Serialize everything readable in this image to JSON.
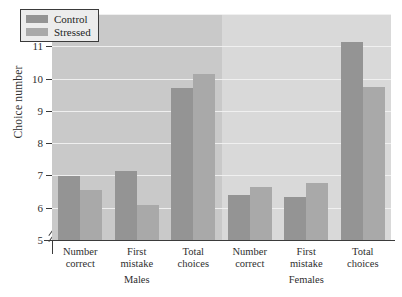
{
  "chart_data": {
    "type": "bar",
    "title": "",
    "xlabel": "",
    "ylabel": "Choice number",
    "ylim": [
      5,
      12
    ],
    "yticks": [
      5,
      6,
      7,
      8,
      9,
      10,
      11,
      12
    ],
    "grid": true,
    "axis_break": true,
    "legend_position": "top-left",
    "groups": [
      {
        "name": "Males",
        "categories": [
          "Number correct",
          "First mistake",
          "Total choices"
        ]
      },
      {
        "name": "Females",
        "categories": [
          "Number correct",
          "First mistake",
          "Total choices"
        ]
      }
    ],
    "categories": [
      "Number correct",
      "First mistake",
      "Total choices",
      "Number correct",
      "First mistake",
      "Total choices"
    ],
    "series": [
      {
        "name": "Control",
        "color": "#949494",
        "values": [
          6.98,
          7.14,
          9.7,
          6.4,
          6.34,
          11.14
        ]
      },
      {
        "name": "Stressed",
        "color": "#a9a9a9",
        "values": [
          6.56,
          6.1,
          10.14,
          6.65,
          6.78,
          9.75
        ]
      }
    ]
  },
  "legend": {
    "items": [
      {
        "label": "Control"
      },
      {
        "label": "Stressed"
      }
    ]
  },
  "axis": {
    "y_label": "Choice number",
    "y_ticks": [
      "12",
      "11",
      "10",
      "9",
      "8",
      "7",
      "6",
      "5"
    ]
  },
  "categories_display": [
    {
      "line1": "Number",
      "line2": "correct"
    },
    {
      "line1": "First",
      "line2": "mistake"
    },
    {
      "line1": "Total",
      "line2": "choices"
    },
    {
      "line1": "Number",
      "line2": "correct"
    },
    {
      "line1": "First",
      "line2": "mistake"
    },
    {
      "line1": "Total",
      "line2": "choices"
    }
  ],
  "group_labels": [
    {
      "label": "Males"
    },
    {
      "label": "Females"
    }
  ],
  "colors": {
    "control": "#949494",
    "stressed": "#a9a9a9",
    "panel_left": "#c9c9c9",
    "panel_right": "#d9d9d9",
    "gridline": "#f2f2f2",
    "axis": "#3b3b3b"
  }
}
